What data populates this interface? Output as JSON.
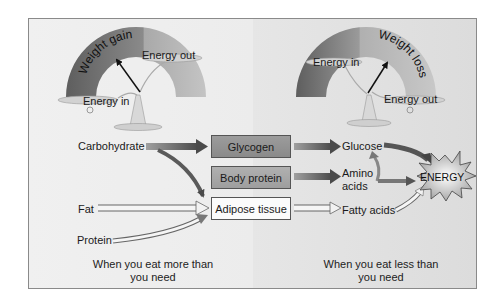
{
  "left_panel": {
    "scale": {
      "arc_label": "Weight gain",
      "left_pan": "Energy in",
      "right_pan": "Energy out"
    },
    "sources": [
      "Carbohydrate",
      "Fat",
      "Protein"
    ],
    "caption_line1": "When you eat more than",
    "caption_line2": "you need"
  },
  "center_boxes": [
    {
      "label": "Glycogen",
      "shade": "dark"
    },
    {
      "label": "Body protein",
      "shade": "mid"
    },
    {
      "label": "Adipose tissue",
      "shade": "light"
    }
  ],
  "right_panel": {
    "scale": {
      "arc_label": "Weight loss",
      "left_pan": "Energy in",
      "right_pan": "Energy out"
    },
    "products": {
      "glucose": "Glucose",
      "amino_line1": "Amino",
      "amino_line2": "acids",
      "fatty_acids": "Fatty acids"
    },
    "energy_label": "ENERGY",
    "caption_line1": "When you eat less than",
    "caption_line2": "you need"
  },
  "colors": {
    "frame_border": "#8a8a8a",
    "background": "#e6e6e6",
    "arc_dark": "#6e6e6e",
    "arc_light": "#b5b5b5",
    "arrow_dark": "#5a5a5a",
    "arrow_light": "#f5f5f5"
  }
}
